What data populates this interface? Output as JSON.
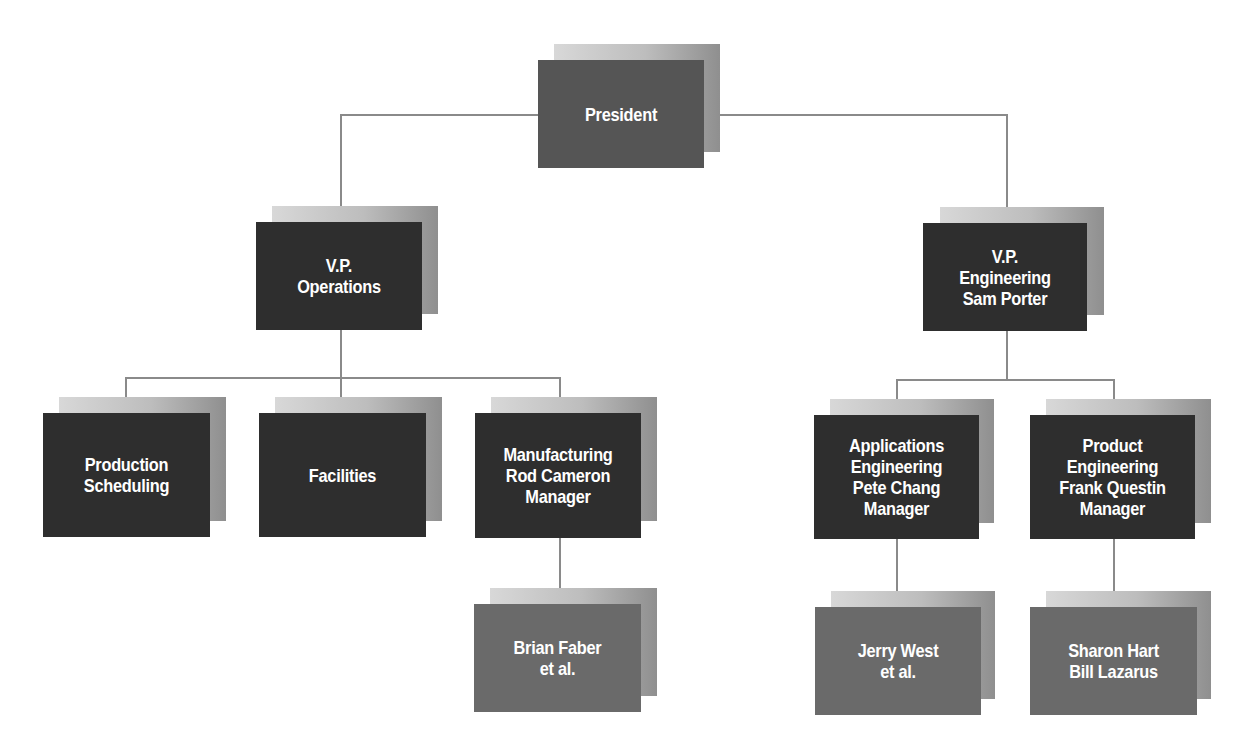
{
  "chart_title": "",
  "nodes": {
    "president": {
      "lines": "President"
    },
    "vp_operations": {
      "lines": "V.P.\nOperations"
    },
    "vp_engineering": {
      "lines": "V.P.\nEngineering\nSam Porter"
    },
    "production_scheduling": {
      "lines": "Production\nScheduling"
    },
    "facilities": {
      "lines": "Facilities"
    },
    "manufacturing": {
      "lines": "Manufacturing\nRod Cameron\nManager"
    },
    "applications_engineering": {
      "lines": "Applications\nEngineering\nPete Chang\nManager"
    },
    "product_engineering": {
      "lines": "Product\nEngineering\nFrank Questin\nManager"
    },
    "brian_faber": {
      "lines": "Brian Faber\net al."
    },
    "jerry_west": {
      "lines": "Jerry West\net al."
    },
    "sharon_bill": {
      "lines": "Sharon Hart\nBill Lazarus"
    }
  },
  "hierarchy": [
    {
      "name": "President",
      "children": [
        {
          "name": "V.P. Operations",
          "children": [
            {
              "name": "Production Scheduling"
            },
            {
              "name": "Facilities"
            },
            {
              "name": "Manufacturing Rod Cameron Manager",
              "children": [
                {
                  "name": "Brian Faber et al."
                }
              ]
            }
          ]
        },
        {
          "name": "V.P. Engineering Sam Porter",
          "children": [
            {
              "name": "Applications Engineering Pete Chang Manager",
              "children": [
                {
                  "name": "Jerry West et al."
                }
              ]
            },
            {
              "name": "Product Engineering Frank Questin Manager",
              "children": [
                {
                  "name": "Sharon Hart Bill Lazarus"
                }
              ]
            }
          ]
        }
      ]
    }
  ],
  "colors": {
    "top_box": "#555555",
    "vp_box": "#2e2e2e",
    "dept_box": "#2e2e2e",
    "staff_box": "#6a6a6a",
    "connector": "#8a8a8a",
    "text": "#ffffff"
  }
}
